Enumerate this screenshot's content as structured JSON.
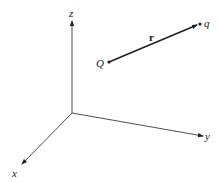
{
  "diagram": {
    "axes": {
      "x_label": "x",
      "y_label": "y",
      "z_label": "z"
    },
    "points": {
      "source_label": "Q",
      "target_label": "q"
    },
    "vector_label": "r",
    "colors": {
      "line": "#222222",
      "background": "#ffffff"
    }
  }
}
